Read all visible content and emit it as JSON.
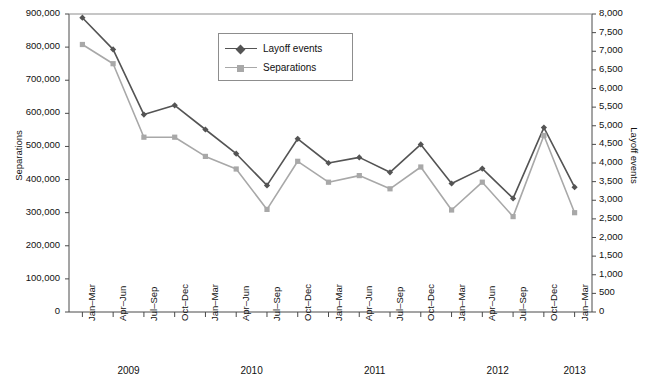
{
  "chart_data": {
    "type": "line",
    "title": "",
    "xlabel": "",
    "categories": [
      "Jan–Mar",
      "Apr–Jun",
      "Jul–Sep",
      "Oct–Dec",
      "Jan–Mar",
      "Apr–Jun",
      "Jul–Sep",
      "Oct–Dec",
      "Jan–Mar",
      "Apr–Jun",
      "Jul–Sep",
      "Oct–Dec",
      "Jan–Mar",
      "Apr–Jun",
      "Jul–Sep",
      "Oct–Dec",
      "Jan–Mar"
    ],
    "year_groups": [
      {
        "label": "2009",
        "start_index": 0,
        "end_index": 3
      },
      {
        "label": "2010",
        "start_index": 4,
        "end_index": 7
      },
      {
        "label": "2011",
        "start_index": 8,
        "end_index": 11
      },
      {
        "label": "2012",
        "start_index": 12,
        "end_index": 15
      },
      {
        "label": "2013",
        "start_index": 16,
        "end_index": 16
      }
    ],
    "series": [
      {
        "name": "Layoff events",
        "axis": "right",
        "color": "#545454",
        "marker": "diamond",
        "values": [
          7900,
          7050,
          5300,
          5550,
          4900,
          4250,
          3400,
          4650,
          4000,
          4150,
          3750,
          4500,
          3450,
          3850,
          3050,
          4950,
          3350
        ]
      },
      {
        "name": "Separations",
        "axis": "left",
        "color": "#a8a8a8",
        "marker": "square",
        "values": [
          808000,
          750000,
          528000,
          528000,
          470000,
          432000,
          310000,
          455000,
          392000,
          412000,
          372000,
          438000,
          308000,
          392000,
          288000,
          533000,
          300000
        ]
      }
    ],
    "yaxis_left": {
      "label": "Separations",
      "min": 0,
      "max": 900000,
      "step": 100000,
      "ticks": [
        "0",
        "100,000",
        "200,000",
        "300,000",
        "400,000",
        "500,000",
        "600,000",
        "700,000",
        "800,000",
        "900,000"
      ]
    },
    "yaxis_right": {
      "label": "Layoff events",
      "min": 0,
      "max": 8000,
      "step": 500,
      "ticks": [
        "0",
        "500",
        "1,000",
        "1,500",
        "2,000",
        "2,500",
        "3,000",
        "3,500",
        "4,000",
        "4,500",
        "5,000",
        "5,500",
        "6,000",
        "6,500",
        "7,000",
        "7,500",
        "8,000"
      ]
    },
    "legend": {
      "position": "top-center-inside",
      "entries": [
        {
          "label": "Layoff events",
          "color": "#545454",
          "marker": "diamond"
        },
        {
          "label": "Separations",
          "color": "#a8a8a8",
          "marker": "square"
        }
      ]
    },
    "grid": false
  }
}
